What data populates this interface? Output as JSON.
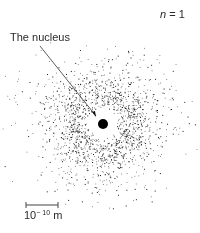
{
  "diagram": {
    "quantum_number_label": {
      "variable": "n",
      "equals": "=",
      "value": "1"
    },
    "nucleus_label": "The nucleus",
    "scale_bar": {
      "base": "10",
      "exponent": "− 10",
      "unit": "m"
    },
    "colors": {
      "background": "#ffffff",
      "dots": "#1a1a1a",
      "nucleus": "#000000"
    }
  }
}
